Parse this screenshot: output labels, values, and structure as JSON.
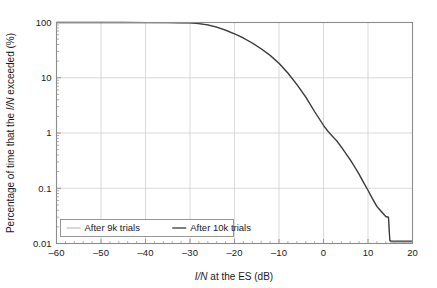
{
  "chart_data": {
    "type": "line",
    "title": "",
    "xlabel": "I/N at the ES (dB)",
    "ylabel": "Percentage of time that the I/N exceeded (%)",
    "xlim": [
      -60,
      20
    ],
    "ylim": [
      0.01,
      100
    ],
    "yscale": "log",
    "xticks": [
      -60,
      -50,
      -40,
      -30,
      -20,
      -10,
      0,
      10,
      20
    ],
    "xtick_labels": [
      "–60",
      "–50",
      "–40",
      "–30",
      "–20",
      "–10",
      "0",
      "10",
      "20"
    ],
    "yticks": [
      100,
      10,
      1,
      0.1,
      0.01
    ],
    "ytick_labels": [
      "100",
      "10",
      "1",
      "0.1",
      "0.01"
    ],
    "grid": true,
    "legend_position": "lower-left-inside",
    "series": [
      {
        "name": "After 9k trials",
        "color": "#b9b9b9",
        "width": 1.1,
        "points": [
          [
            -60,
            100
          ],
          [
            -55,
            100
          ],
          [
            -50,
            100
          ],
          [
            -45,
            99.9
          ],
          [
            -40,
            99.8
          ],
          [
            -35,
            99.5
          ],
          [
            -32,
            99.0
          ],
          [
            -30,
            98.0
          ],
          [
            -28,
            95.0
          ],
          [
            -26,
            90.0
          ],
          [
            -24,
            82.0
          ],
          [
            -22,
            72.0
          ],
          [
            -20,
            62.0
          ],
          [
            -18,
            52.0
          ],
          [
            -16,
            42.0
          ],
          [
            -14,
            33.0
          ],
          [
            -12,
            25.0
          ],
          [
            -10,
            18.0
          ],
          [
            -8,
            12.0
          ],
          [
            -6,
            7.5
          ],
          [
            -4,
            4.4
          ],
          [
            -2,
            2.4
          ],
          [
            0,
            1.35
          ],
          [
            1,
            1.05
          ],
          [
            2,
            0.86
          ],
          [
            3,
            0.7
          ],
          [
            4,
            0.55
          ],
          [
            5,
            0.42
          ],
          [
            6,
            0.32
          ],
          [
            7,
            0.24
          ],
          [
            8,
            0.175
          ],
          [
            9,
            0.125
          ],
          [
            10,
            0.09
          ],
          [
            11,
            0.063
          ],
          [
            12,
            0.046
          ],
          [
            13,
            0.037
          ],
          [
            14,
            0.03
          ],
          [
            14.6,
            0.029
          ],
          [
            14.9,
            0.011
          ],
          [
            15.2,
            0.0105
          ],
          [
            18,
            0.0105
          ],
          [
            20,
            0.0105
          ]
        ]
      },
      {
        "name": "After 10k trials",
        "color": "#3a3a3a",
        "width": 1.3,
        "points": [
          [
            -60,
            100
          ],
          [
            -55,
            100
          ],
          [
            -50,
            100
          ],
          [
            -45,
            99.9
          ],
          [
            -40,
            99.8
          ],
          [
            -35,
            99.5
          ],
          [
            -32,
            99.0
          ],
          [
            -30,
            98.2
          ],
          [
            -28,
            95.5
          ],
          [
            -26,
            90.5
          ],
          [
            -24,
            82.5
          ],
          [
            -22,
            72.5
          ],
          [
            -20,
            62.5
          ],
          [
            -18,
            52.5
          ],
          [
            -16,
            42.5
          ],
          [
            -14,
            33.5
          ],
          [
            -12,
            25.5
          ],
          [
            -10,
            18.3
          ],
          [
            -8,
            12.2
          ],
          [
            -6,
            7.6
          ],
          [
            -4,
            4.5
          ],
          [
            -2,
            2.45
          ],
          [
            0,
            1.38
          ],
          [
            1,
            1.08
          ],
          [
            2,
            0.88
          ],
          [
            3,
            0.72
          ],
          [
            4,
            0.56
          ],
          [
            5,
            0.43
          ],
          [
            6,
            0.33
          ],
          [
            7,
            0.245
          ],
          [
            8,
            0.18
          ],
          [
            9,
            0.128
          ],
          [
            10,
            0.092
          ],
          [
            11,
            0.065
          ],
          [
            12,
            0.047
          ],
          [
            13,
            0.038
          ],
          [
            14,
            0.031
          ],
          [
            14.6,
            0.03
          ],
          [
            14.9,
            0.0115
          ],
          [
            15.2,
            0.011
          ],
          [
            18,
            0.011
          ],
          [
            20,
            0.011
          ]
        ]
      }
    ],
    "colors": {
      "frame": "#8c8c8c",
      "grid": "#cfcfcf",
      "text": "#1a1a1a",
      "background": "#ffffff",
      "legend_border": "#8c8c8c"
    }
  }
}
